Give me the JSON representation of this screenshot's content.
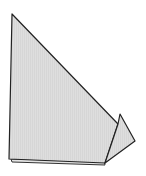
{
  "diagram": {
    "type": "folded-paper-shape",
    "background": "#ffffff",
    "fill": "#dcdcdc",
    "stroke": "#222222",
    "shapes": {
      "back_sheet": "12,162 105,165 104,161 11,159",
      "main_triangle": "12,14 9,159 105,163 118,124",
      "flap": "118,124 120,114 135,141 105,163"
    }
  }
}
